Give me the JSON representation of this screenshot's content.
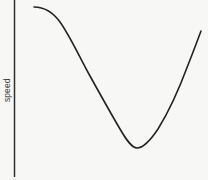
{
  "chart_data": {
    "type": "line",
    "title": "",
    "subtitle": "",
    "xlabel": "",
    "ylabel": "speed",
    "grid": false,
    "legend": null,
    "axes": {
      "y_axis_line": true,
      "x_axis_line": false,
      "y_tick_labels": [],
      "x_tick_labels": []
    },
    "xlim": [
      0,
      100
    ],
    "ylim": [
      0,
      100
    ],
    "series": [
      {
        "name": "speed-curve",
        "color": "#232323",
        "x": [
          10.6,
          16.5,
          22.4,
          28.2,
          34.1,
          40.0,
          45.9,
          51.8,
          57.6,
          63.5,
          69.4,
          75.3,
          81.2,
          87.1,
          92.9,
          97.6
        ],
        "values": [
          96.1,
          94.4,
          89.4,
          82.2,
          73.3,
          62.2,
          50.0,
          37.2,
          26.1,
          19.4,
          17.8,
          21.7,
          30.0,
          43.3,
          62.2,
          82.8
        ]
      }
    ],
    "annotations": [],
    "colors": {
      "background": "#f7f7f6",
      "axis": "#2e2e2e",
      "curve": "#232323",
      "label_text": "#3a3a3a"
    },
    "path_geometry": {
      "units": "pixels",
      "viewbox": [
        0,
        0,
        208,
        180
      ],
      "d": "M 34 7 C 44 7 52 11 60 22 C 70 36 80 58 90 76 C 100 94 110 112 120 129 C 127 141 132 148 137 148 C 143 148 150 141 158 129 C 168 113 178 92 188 65 C 194 50 198 39 201 31",
      "stroke_width": 1.6,
      "axis_x": 14.5,
      "axis_y_top": 0,
      "axis_y_bottom": 177
    }
  },
  "labels": {
    "y_axis": "speed"
  }
}
